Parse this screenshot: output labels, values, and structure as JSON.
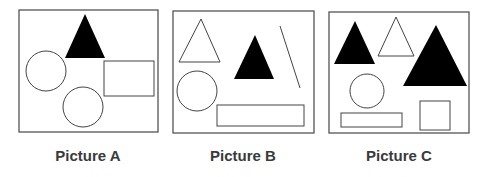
{
  "colors": {
    "stroke": "#555555",
    "fill_black": "#000000",
    "label": "#3a3a3a",
    "background": "#ffffff"
  },
  "pictures": [
    {
      "label": "Picture A",
      "label_x": 88,
      "frame": {
        "x": 19,
        "y": 10,
        "w": 139,
        "h": 122
      },
      "shapes": [
        {
          "type": "triangle",
          "fill": "black",
          "points": "85,14 65,58 105,58"
        },
        {
          "type": "circle",
          "fill": "none",
          "cx": 46,
          "cy": 71,
          "r": 20
        },
        {
          "type": "rect",
          "fill": "none",
          "x": 104,
          "y": 61,
          "w": 50,
          "h": 35
        },
        {
          "type": "circle",
          "fill": "none",
          "cx": 83,
          "cy": 107,
          "r": 20
        }
      ]
    },
    {
      "label": "Picture B",
      "label_x": 243,
      "frame": {
        "x": 173,
        "y": 11,
        "w": 141,
        "h": 122
      },
      "shapes": [
        {
          "type": "triangle",
          "fill": "none",
          "points": "201,19 179,62 220,62"
        },
        {
          "type": "triangle",
          "fill": "black",
          "points": "255,35 234,79 274,79"
        },
        {
          "type": "line",
          "x1": 280,
          "y1": 26,
          "x2": 300,
          "y2": 88
        },
        {
          "type": "circle",
          "fill": "none",
          "cx": 197,
          "cy": 91,
          "r": 20
        },
        {
          "type": "rect",
          "fill": "none",
          "x": 217,
          "y": 105,
          "w": 87,
          "h": 21
        }
      ]
    },
    {
      "label": "Picture C",
      "label_x": 399,
      "frame": {
        "x": 329,
        "y": 12,
        "w": 140,
        "h": 121
      },
      "shapes": [
        {
          "type": "triangle",
          "fill": "black",
          "points": "355,21 334,64 375,64"
        },
        {
          "type": "triangle",
          "fill": "none",
          "points": "396,17 378,56 414,56"
        },
        {
          "type": "triangle",
          "fill": "black",
          "points": "436,25 403,86 467,86"
        },
        {
          "type": "circle",
          "fill": "none",
          "cx": 367,
          "cy": 91,
          "r": 17
        },
        {
          "type": "rect",
          "fill": "none",
          "x": 341,
          "y": 113,
          "w": 61,
          "h": 14
        },
        {
          "type": "rect",
          "fill": "none",
          "x": 420,
          "y": 101,
          "w": 30,
          "h": 29
        }
      ]
    }
  ]
}
